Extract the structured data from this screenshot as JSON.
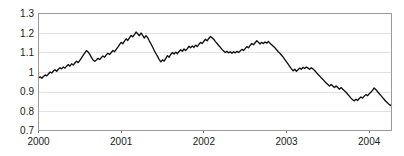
{
  "chart_data": {
    "type": "line",
    "title": "",
    "subtitle": "",
    "xlabel": "",
    "ylabel": "",
    "grid": true,
    "legend": false,
    "legend_position": "none",
    "line_color": "#111111",
    "grid_color": "#d9d9d9",
    "frame_color": "#9a9a9a",
    "background_color": "#ffffff",
    "xlim": [
      2000.0,
      2004.27
    ],
    "ylim": [
      0.7,
      1.3
    ],
    "yticks": [
      0.7,
      0.8,
      0.9,
      1.0,
      1.1,
      1.2,
      1.3
    ],
    "ytick_labels": [
      "0.7",
      "0.8",
      "0.9",
      "1",
      "1.1",
      "1.2",
      "1.3"
    ],
    "xticks": [
      2000,
      2001,
      2002,
      2003,
      2004
    ],
    "xtick_labels": [
      "2000",
      "2001",
      "2002",
      "2003",
      "2004"
    ],
    "series": [
      {
        "name": "exchange-rate",
        "x": [
          2000.0,
          2000.02,
          2000.04,
          2000.06,
          2000.08,
          2000.1,
          2000.12,
          2000.14,
          2000.16,
          2000.18,
          2000.2,
          2000.22,
          2000.24,
          2000.26,
          2000.28,
          2000.3,
          2000.32,
          2000.34,
          2000.36,
          2000.38,
          2000.4,
          2000.42,
          2000.44,
          2000.46,
          2000.48,
          2000.5,
          2000.52,
          2000.54,
          2000.56,
          2000.58,
          2000.6,
          2000.62,
          2000.64,
          2000.66,
          2000.68,
          2000.7,
          2000.72,
          2000.74,
          2000.76,
          2000.78,
          2000.8,
          2000.82,
          2000.84,
          2000.86,
          2000.88,
          2000.9,
          2000.92,
          2000.94,
          2000.96,
          2000.98,
          2001.0,
          2001.02,
          2001.04,
          2001.06,
          2001.08,
          2001.1,
          2001.12,
          2001.14,
          2001.16,
          2001.18,
          2001.2,
          2001.22,
          2001.24,
          2001.26,
          2001.28,
          2001.3,
          2001.32,
          2001.34,
          2001.36,
          2001.38,
          2001.4,
          2001.42,
          2001.44,
          2001.46,
          2001.48,
          2001.5,
          2001.52,
          2001.54,
          2001.56,
          2001.58,
          2001.6,
          2001.62,
          2001.64,
          2001.66,
          2001.68,
          2001.7,
          2001.72,
          2001.74,
          2001.76,
          2001.78,
          2001.8,
          2001.82,
          2001.84,
          2001.86,
          2001.88,
          2001.9,
          2001.92,
          2001.94,
          2001.96,
          2001.98,
          2002.0,
          2002.02,
          2002.04,
          2002.06,
          2002.08,
          2002.1,
          2002.12,
          2002.14,
          2002.16,
          2002.18,
          2002.2,
          2002.22,
          2002.24,
          2002.26,
          2002.28,
          2002.3,
          2002.32,
          2002.34,
          2002.36,
          2002.38,
          2002.4,
          2002.42,
          2002.44,
          2002.46,
          2002.48,
          2002.5,
          2002.52,
          2002.54,
          2002.56,
          2002.58,
          2002.6,
          2002.62,
          2002.64,
          2002.66,
          2002.68,
          2002.7,
          2002.72,
          2002.74,
          2002.76,
          2002.78,
          2002.8,
          2002.82,
          2002.84,
          2002.86,
          2002.88,
          2002.9,
          2002.92,
          2002.94,
          2002.96,
          2002.98,
          2003.0,
          2003.02,
          2003.04,
          2003.06,
          2003.08,
          2003.1,
          2003.12,
          2003.14,
          2003.16,
          2003.18,
          2003.2,
          2003.22,
          2003.24,
          2003.26,
          2003.28,
          2003.3,
          2003.32,
          2003.34,
          2003.36,
          2003.38,
          2003.4,
          2003.42,
          2003.44,
          2003.46,
          2003.48,
          2003.5,
          2003.52,
          2003.54,
          2003.56,
          2003.58,
          2003.6,
          2003.62,
          2003.64,
          2003.66,
          2003.68,
          2003.7,
          2003.72,
          2003.74,
          2003.76,
          2003.78,
          2003.8,
          2003.82,
          2003.84,
          2003.86,
          2003.88,
          2003.9,
          2003.92,
          2003.94,
          2003.96,
          2003.98,
          2004.0,
          2004.02,
          2004.04,
          2004.06,
          2004.08,
          2004.1,
          2004.12,
          2004.14,
          2004.16,
          2004.18,
          2004.2,
          2004.22,
          2004.24,
          2004.27
        ],
        "values": [
          0.97,
          0.975,
          0.968,
          0.977,
          0.985,
          0.98,
          0.99,
          1.0,
          0.995,
          1.005,
          1.012,
          1.004,
          1.014,
          1.022,
          1.016,
          1.026,
          1.02,
          1.03,
          1.038,
          1.03,
          1.042,
          1.036,
          1.046,
          1.055,
          1.048,
          1.06,
          1.072,
          1.085,
          1.098,
          1.11,
          1.103,
          1.09,
          1.075,
          1.062,
          1.055,
          1.062,
          1.07,
          1.064,
          1.074,
          1.082,
          1.076,
          1.088,
          1.096,
          1.09,
          1.1,
          1.11,
          1.104,
          1.116,
          1.128,
          1.14,
          1.152,
          1.145,
          1.158,
          1.17,
          1.162,
          1.175,
          1.188,
          1.18,
          1.192,
          1.205,
          1.196,
          1.186,
          1.2,
          1.188,
          1.174,
          1.186,
          1.176,
          1.16,
          1.145,
          1.128,
          1.11,
          1.095,
          1.08,
          1.064,
          1.052,
          1.062,
          1.056,
          1.07,
          1.084,
          1.076,
          1.09,
          1.1,
          1.092,
          1.102,
          1.094,
          1.105,
          1.114,
          1.106,
          1.118,
          1.11,
          1.12,
          1.132,
          1.124,
          1.134,
          1.126,
          1.138,
          1.13,
          1.142,
          1.152,
          1.146,
          1.158,
          1.168,
          1.16,
          1.172,
          1.182,
          1.175,
          1.168,
          1.156,
          1.146,
          1.136,
          1.126,
          1.116,
          1.108,
          1.1,
          1.106,
          1.098,
          1.104,
          1.096,
          1.104,
          1.098,
          1.106,
          1.1,
          1.108,
          1.116,
          1.11,
          1.12,
          1.13,
          1.124,
          1.136,
          1.146,
          1.14,
          1.15,
          1.16,
          1.152,
          1.144,
          1.152,
          1.146,
          1.154,
          1.148,
          1.156,
          1.148,
          1.14,
          1.132,
          1.124,
          1.114,
          1.104,
          1.096,
          1.086,
          1.076,
          1.064,
          1.052,
          1.04,
          1.028,
          1.016,
          1.006,
          1.014,
          1.004,
          1.012,
          1.02,
          1.014,
          1.024,
          1.018,
          1.026,
          1.02,
          1.014,
          1.022,
          1.016,
          1.008,
          0.998,
          0.988,
          0.98,
          0.97,
          0.962,
          0.952,
          0.944,
          0.936,
          0.928,
          0.936,
          0.928,
          0.92,
          0.928,
          0.92,
          0.912,
          0.92,
          0.912,
          0.904,
          0.896,
          0.886,
          0.876,
          0.866,
          0.858,
          0.852,
          0.86,
          0.854,
          0.864,
          0.872,
          0.866,
          0.876,
          0.884,
          0.878,
          0.888,
          0.896,
          0.906,
          0.918,
          0.91,
          0.9,
          0.89,
          0.88,
          0.87,
          0.86,
          0.85,
          0.842,
          0.834,
          0.826
        ]
      }
    ]
  }
}
